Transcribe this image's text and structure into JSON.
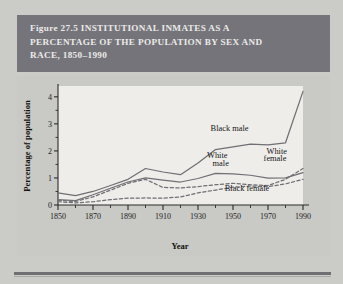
{
  "figure": {
    "label": "Figure 27.5",
    "title_lines": "Figure 27.5  INSTITUTIONAL INMATES AS A\nPERCENTAGE OF THE POPULATION BY SEX AND\nRACE, 1850–1990",
    "banner_color": "#74747a",
    "banner_text_color": "#ecebe8",
    "page_background": "#cbcbc7",
    "plot_background": "#eeedea"
  },
  "chart_data": {
    "type": "line",
    "xlabel": "Year",
    "ylabel": "Percentage of population",
    "xlim": [
      1850,
      1990
    ],
    "ylim": [
      0,
      4.4
    ],
    "yticks": [
      0,
      1,
      2,
      3,
      4
    ],
    "ytick_labels": [
      "0",
      "1",
      "2",
      "3",
      "4"
    ],
    "xticks": [
      1850,
      1870,
      1890,
      1910,
      1930,
      1950,
      1970,
      1990
    ],
    "xtick_labels": [
      "1850",
      "1870",
      "1890",
      "1910",
      "1930",
      "1950",
      "1970",
      "1990"
    ],
    "x_minor_ticks": [
      1860,
      1880,
      1900,
      1920,
      1940,
      1960,
      1980
    ],
    "grid": false,
    "legend_position": "inline-annotations",
    "x": [
      1850,
      1860,
      1870,
      1880,
      1890,
      1900,
      1910,
      1920,
      1930,
      1940,
      1950,
      1960,
      1970,
      1980,
      1990
    ],
    "series": [
      {
        "name": "Black male",
        "label": "Black male",
        "style": "solid",
        "color": "#6f6f74",
        "values": [
          0.45,
          0.35,
          0.5,
          0.72,
          0.95,
          1.35,
          1.22,
          1.12,
          1.55,
          2.05,
          2.15,
          2.25,
          2.22,
          2.3,
          4.2
        ]
      },
      {
        "name": "White male",
        "label": "White male",
        "style": "solid",
        "color": "#6f6f74",
        "values": [
          0.2,
          0.16,
          0.38,
          0.62,
          0.85,
          1.0,
          0.92,
          0.85,
          0.98,
          1.17,
          1.15,
          1.1,
          0.99,
          1.0,
          1.2
        ]
      },
      {
        "name": "White female",
        "label": "White female",
        "style": "dashed",
        "color": "#6f6f74",
        "values": [
          0.17,
          0.13,
          0.3,
          0.55,
          0.8,
          0.95,
          0.65,
          0.63,
          0.68,
          0.75,
          0.8,
          0.75,
          0.72,
          0.95,
          1.35
        ]
      },
      {
        "name": "Black female",
        "label": "Black female",
        "style": "dashed",
        "color": "#6f6f74",
        "values": [
          0.12,
          0.08,
          0.12,
          0.2,
          0.25,
          0.26,
          0.25,
          0.3,
          0.45,
          0.55,
          0.66,
          0.7,
          0.68,
          0.78,
          0.95
        ]
      }
    ],
    "annotations": [
      {
        "text": "Black male",
        "x": 1948,
        "y": 2.72
      },
      {
        "text": "White",
        "x": 1941,
        "y": 1.72
      },
      {
        "text": "male",
        "x": 1943,
        "y": 1.46
      },
      {
        "text": "White",
        "x": 1975,
        "y": 1.88
      },
      {
        "text": "female",
        "x": 1974,
        "y": 1.62
      },
      {
        "text": "Black female",
        "x": 1958,
        "y": 0.5
      }
    ]
  }
}
